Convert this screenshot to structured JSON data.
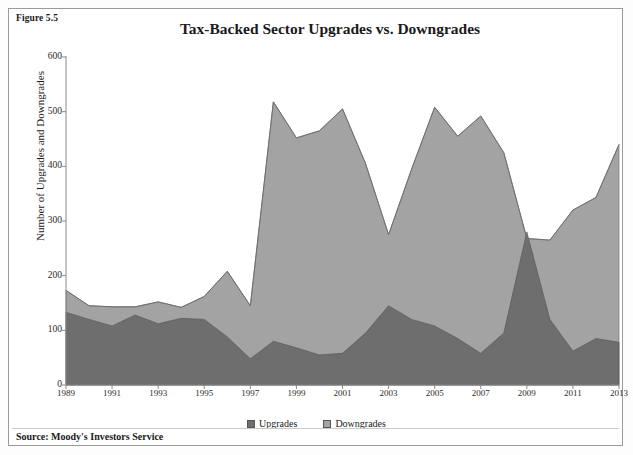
{
  "figure": {
    "label": "Figure 5.5",
    "source": "Source: Moody's Investors Service"
  },
  "legend": {
    "position": "bottom-center",
    "items": [
      {
        "label": "Upgrades",
        "color": "#6e6e6e"
      },
      {
        "label": "Downgrades",
        "color": "#a3a3a3"
      }
    ]
  },
  "chart_data": {
    "type": "area",
    "stacked": true,
    "title": "Tax-Backed Sector Upgrades vs. Downgrades",
    "xlabel": "",
    "ylabel": "Number of Upgrades and Downgrades",
    "grid": false,
    "ylim": [
      0,
      600
    ],
    "yticks": [
      0,
      100,
      200,
      300,
      400,
      500,
      600
    ],
    "xlim": [
      1989,
      2013
    ],
    "xticks": [
      1989,
      1991,
      1993,
      1995,
      1997,
      1999,
      2001,
      2003,
      2005,
      2007,
      2009,
      2011,
      2013
    ],
    "x": [
      1989,
      1990,
      1991,
      1992,
      1993,
      1994,
      1995,
      1996,
      1997,
      1998,
      1999,
      2000,
      2001,
      2002,
      2003,
      2004,
      2005,
      2006,
      2007,
      2008,
      2009,
      2010,
      2011,
      2012,
      2013
    ],
    "series": [
      {
        "name": "Upgrades",
        "color": "#6e6e6e",
        "values": [
          133,
          120,
          108,
          128,
          112,
          122,
          120,
          88,
          48,
          80,
          68,
          55,
          58,
          95,
          145,
          120,
          108,
          85,
          58,
          95,
          280,
          120,
          62,
          85,
          78
        ]
      },
      {
        "name": "Downgrades",
        "color": "#a3a3a3",
        "values": [
          40,
          25,
          35,
          15,
          40,
          20,
          42,
          120,
          97,
          438,
          384,
          410,
          447,
          310,
          130,
          275,
          400,
          370,
          434,
          330,
          -12,
          145,
          258,
          258,
          362
        ]
      }
    ],
    "totals": [
      173,
      145,
      143,
      143,
      152,
      142,
      162,
      208,
      145,
      518,
      452,
      465,
      505,
      405,
      275,
      395,
      508,
      455,
      492,
      425,
      268,
      265,
      320,
      343,
      440
    ],
    "annotations": []
  }
}
